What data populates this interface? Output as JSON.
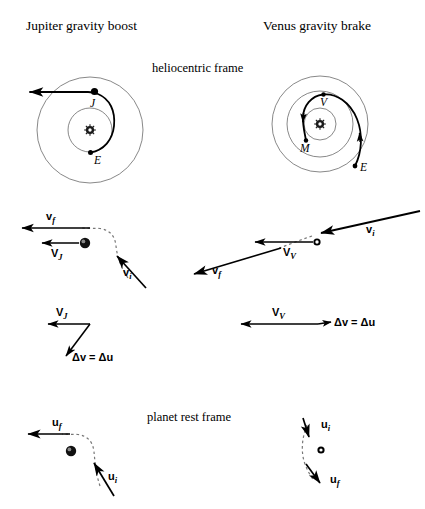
{
  "figure": {
    "width": 425,
    "height": 509,
    "background": "#ffffff",
    "stroke_color": "#000000",
    "orbit_stroke_color": "#555555"
  },
  "titles": {
    "left": "Jupiter gravity boost",
    "right": "Venus gravity brake"
  },
  "frames": {
    "heliocentric": "heliocentric frame",
    "planet_rest": "planet rest frame"
  },
  "panel_left_orbits": {
    "sun_symbol": "sun-icon",
    "planet_labels": [
      {
        "label": "J",
        "name": "jupiter-marker"
      },
      {
        "label": "E",
        "name": "earth-marker"
      }
    ]
  },
  "panel_right_orbits": {
    "sun_symbol": "sun-icon",
    "planet_labels": [
      {
        "label": "V",
        "name": "venus-marker"
      },
      {
        "label": "M",
        "name": "mercury-marker"
      },
      {
        "label": "E",
        "name": "earth-marker"
      }
    ]
  },
  "vectors_heliocentric_left": [
    {
      "name": "v-final-vector",
      "symbol": "v",
      "sub": "f"
    },
    {
      "name": "planet-velocity-vector",
      "symbol": "V",
      "sub": "J"
    },
    {
      "name": "v-initial-vector",
      "symbol": "v",
      "sub": "i"
    }
  ],
  "vectors_heliocentric_right": [
    {
      "name": "v-initial-vector",
      "symbol": "v",
      "sub": "i"
    },
    {
      "name": "planet-velocity-vector",
      "symbol": "V",
      "sub": "V"
    },
    {
      "name": "v-final-vector",
      "symbol": "v",
      "sub": "f"
    }
  ],
  "delta_v_left": {
    "planet_velocity": {
      "symbol": "V",
      "sub": "J"
    },
    "equation": "Δv = Δu"
  },
  "delta_v_right": {
    "planet_velocity": {
      "symbol": "V",
      "sub": "V"
    },
    "equation": "Δv = Δu"
  },
  "vectors_rest_left": [
    {
      "name": "u-final-vector",
      "symbol": "u",
      "sub": "f"
    },
    {
      "name": "u-initial-vector",
      "symbol": "u",
      "sub": "i"
    }
  ],
  "vectors_rest_right": [
    {
      "name": "u-initial-vector",
      "symbol": "u",
      "sub": "i"
    },
    {
      "name": "u-final-vector",
      "symbol": "u",
      "sub": "f"
    }
  ]
}
